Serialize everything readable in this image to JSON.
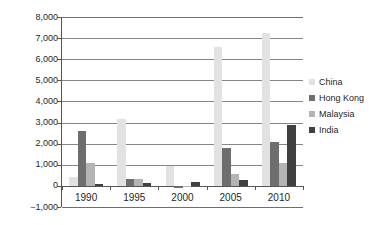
{
  "chart_data": {
    "type": "bar",
    "title": "",
    "subtitle": "",
    "xlabel": "",
    "ylabel": "JP¥m",
    "categories": [
      "1990",
      "1995",
      "2000",
      "2005",
      "2010"
    ],
    "ylim": [
      -1000,
      8000
    ],
    "y_tick_step": 1000,
    "y_ticks": [
      "8,000",
      "7,000",
      "6,000",
      "5,000",
      "4,000",
      "3,000",
      "2,000",
      "1,000",
      "0",
      "−1,000"
    ],
    "y_tick_values": [
      8000,
      7000,
      6000,
      5000,
      4000,
      3000,
      2000,
      1000,
      0,
      -1000
    ],
    "grid": true,
    "grid_axis": "y",
    "legend_position": "right",
    "series": [
      {
        "name": "China",
        "color": "#e2e2e2",
        "values": [
          400,
          3150,
          950,
          6560,
          7250
        ]
      },
      {
        "name": "Hong Kong",
        "color": "#6e6e6e",
        "values": [
          2610,
          320,
          -80,
          1810,
          2100
        ]
      },
      {
        "name": "Malaysia",
        "color": "#b4b4b4",
        "values": [
          1090,
          350,
          10,
          540,
          1080
        ]
      },
      {
        "name": "India",
        "color": "#404040",
        "values": [
          75,
          120,
          175,
          260,
          2880
        ]
      }
    ]
  },
  "legend": {
    "entries": [
      {
        "label": "China",
        "color": "#e2e2e2"
      },
      {
        "label": "Hong Kong",
        "color": "#6e6e6e"
      },
      {
        "label": "Malaysia",
        "color": "#b4b4b4"
      },
      {
        "label": "India",
        "color": "#404040"
      }
    ]
  },
  "colors": {
    "china": "#e2e2e2",
    "hong_kong": "#6e6e6e",
    "malaysia": "#b4b4b4",
    "india": "#404040",
    "gridline": "#868686",
    "axis": "#555555",
    "text": "#1f1f1f",
    "background": "#ffffff"
  }
}
